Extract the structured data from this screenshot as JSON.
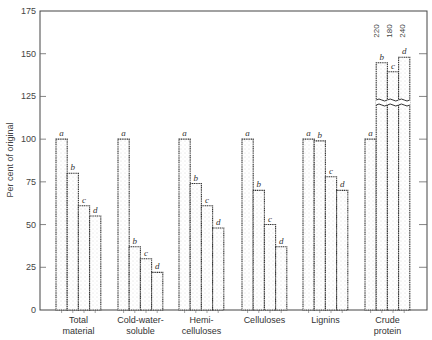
{
  "chart_data": {
    "type": "bar",
    "title": "",
    "xlabel": "",
    "ylabel": "Per cent of original",
    "ylim": [
      0,
      175
    ],
    "yticks": [
      0,
      25,
      50,
      75,
      100,
      125,
      150,
      175
    ],
    "grid": false,
    "legend": "none (bars labelled a, b, c, d)",
    "categories": [
      "Total material",
      "Cold-water-soluble",
      "Hemi-celluloses",
      "Celluloses",
      "Lignins",
      "Crude protein"
    ],
    "category_lines": [
      [
        "Total",
        "material"
      ],
      [
        "Cold-water-",
        "soluble"
      ],
      [
        "Hemi-",
        "celluloses"
      ],
      [
        "Celluloses",
        ""
      ],
      [
        "Lignins",
        ""
      ],
      [
        "Crude",
        "protein"
      ]
    ],
    "series": [
      {
        "name": "a",
        "values": [
          100,
          100,
          100,
          100,
          100,
          100
        ]
      },
      {
        "name": "b",
        "values": [
          80,
          37,
          74,
          70,
          99,
          220
        ]
      },
      {
        "name": "c",
        "values": [
          61,
          30,
          61,
          50,
          78,
          180
        ]
      },
      {
        "name": "d",
        "values": [
          55,
          22,
          48,
          37,
          70,
          240
        ]
      }
    ],
    "annotations": [
      {
        "text": "220",
        "target": "Crude protein b"
      },
      {
        "text": "180",
        "target": "Crude protein c"
      },
      {
        "text": "240",
        "target": "Crude protein d"
      },
      {
        "text": "broken bars (axis break) for Crude protein b, c, d"
      }
    ]
  }
}
